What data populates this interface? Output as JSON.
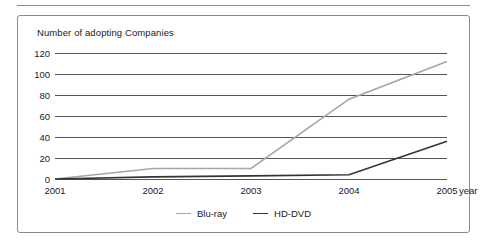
{
  "figure": {
    "has_top_rule": true,
    "frame_border_color": "#8a8a8a"
  },
  "chart_data": {
    "type": "line",
    "title": "Number of adopting Companies",
    "xlabel": "year",
    "ylabel": "",
    "categories": [
      "2001",
      "2002",
      "2003",
      "2004",
      "2005"
    ],
    "x": [
      2001,
      2002,
      2003,
      2004,
      2005
    ],
    "series": [
      {
        "name": "Blu-ray",
        "color": "#a6a6a6",
        "values": [
          0,
          10,
          10,
          76,
          112
        ]
      },
      {
        "name": "HD-DVD",
        "color": "#333333",
        "values": [
          0,
          2,
          3,
          4,
          36
        ]
      }
    ],
    "ylim": [
      0,
      120
    ],
    "ytick_values": [
      0,
      20,
      40,
      60,
      80,
      100,
      120
    ],
    "ytick_labels": [
      "0",
      "20",
      "40",
      "60",
      "80",
      "100",
      "120"
    ],
    "xtick_labels": [
      "2001",
      "2002",
      "2003",
      "2004",
      "2005"
    ],
    "grid": true,
    "grid_color": "#555555",
    "legend_position": "bottom-center",
    "legend_entries": [
      "Blu-ray",
      "HD-DVD"
    ]
  }
}
